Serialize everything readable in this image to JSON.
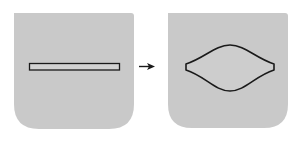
{
  "diagram": {
    "colors": {
      "background": "#ffffff",
      "panel_fill": "#c9c9c9",
      "outline": "#1a1a1a",
      "slit_fill": "#d4d4d4"
    },
    "panels": [
      {
        "id": "before",
        "shape": "closed-slit"
      },
      {
        "id": "after",
        "shape": "open-lens"
      }
    ],
    "arrow": {
      "icon": "arrow-right-icon",
      "direction": "right"
    }
  }
}
